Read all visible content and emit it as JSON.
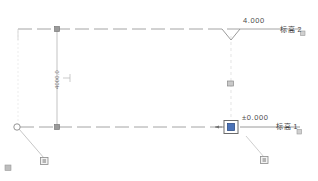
{
  "view": {
    "type": "elevation-view",
    "background": "#ffffff"
  },
  "levels": [
    {
      "id": "level-2",
      "elevation_value": "4.000",
      "name": "标高 2",
      "y": 29,
      "selected": false
    },
    {
      "id": "level-1",
      "elevation_value": "±0.000",
      "name": "标高 1",
      "y": 127,
      "selected": true
    }
  ],
  "dimension": {
    "value": "4000.0",
    "x": 57,
    "y_top": 29,
    "y_bottom": 127
  },
  "colors": {
    "level_line": "#9a9a9a",
    "dimension_line": "#b0b0b0",
    "text": "#3a3a3a",
    "selection": "#4a72b8",
    "grip_fill": "#ffffff",
    "grip_stroke": "#7a7a7a",
    "reference_line": "#d2d2d2"
  },
  "grips": [
    {
      "name": "round-grip-left",
      "shape": "circle",
      "x": 17,
      "y": 127
    },
    {
      "name": "square-grip-drag-lower-left",
      "shape": "square",
      "x": 44,
      "y": 160
    },
    {
      "name": "square-grip-drag-lower-right",
      "shape": "square",
      "x": 264,
      "y": 160
    },
    {
      "name": "square-grip-dim-top",
      "shape": "square",
      "x": 57,
      "y": 29
    },
    {
      "name": "square-grip-dim-bottom",
      "shape": "square",
      "x": 57,
      "y": 127
    },
    {
      "name": "square-grip-reference-mid",
      "shape": "square",
      "x": 230,
      "y": 84
    },
    {
      "name": "square-grip-level-head-selected",
      "shape": "square",
      "x": 231,
      "y": 127
    }
  ],
  "corner_mark": {
    "label": "▣",
    "x": 6,
    "y": 167
  },
  "badges": [
    {
      "name": "level-2-badge",
      "x": 303,
      "y": 33
    },
    {
      "name": "level-1-badge",
      "x": 299,
      "y": 131
    }
  ]
}
